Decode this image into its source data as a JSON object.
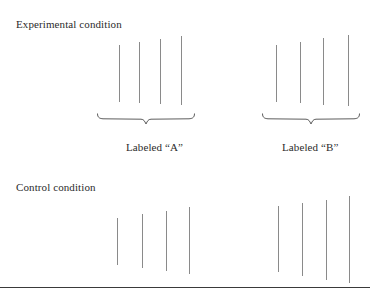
{
  "figure": {
    "width": 370,
    "height": 295,
    "background_color": "#ffffff",
    "line_color": "#8a8a8a",
    "brace_color": "#5d5d5d",
    "text_color": "#2b2b2b",
    "rule_color": "#3a3a3a"
  },
  "conditions": [
    {
      "id": "experimental",
      "label": "Experimental condition",
      "label_x": 16,
      "label_y": 18,
      "groups": [
        {
          "id": "group-a",
          "label": "Labeled “A”",
          "label_x": 126,
          "label_y": 141,
          "brace": {
            "x": 97,
            "y": 113,
            "width": 98,
            "height": 12
          },
          "lines": [
            {
              "x": 119,
              "top": 45,
              "bottom": 102
            },
            {
              "x": 139,
              "top": 42,
              "bottom": 103
            },
            {
              "x": 160,
              "top": 39,
              "bottom": 104
            },
            {
              "x": 181,
              "top": 36,
              "bottom": 105
            }
          ]
        },
        {
          "id": "group-b",
          "label": "Labeled “B”",
          "label_x": 282,
          "label_y": 141,
          "brace": {
            "x": 262,
            "y": 113,
            "width": 98,
            "height": 12
          },
          "lines": [
            {
              "x": 276,
              "top": 45,
              "bottom": 102
            },
            {
              "x": 300,
              "top": 42,
              "bottom": 103
            },
            {
              "x": 323,
              "top": 38,
              "bottom": 105
            },
            {
              "x": 348,
              "top": 35,
              "bottom": 106
            }
          ]
        }
      ]
    },
    {
      "id": "control",
      "label": "Control condition",
      "label_x": 16,
      "label_y": 181,
      "groups": [
        {
          "id": "control-left",
          "label": "",
          "label_x": 0,
          "label_y": 0,
          "brace": null,
          "lines": [
            {
              "x": 117,
              "top": 218,
              "bottom": 265
            },
            {
              "x": 142,
              "top": 214,
              "bottom": 268
            },
            {
              "x": 166,
              "top": 211,
              "bottom": 271
            },
            {
              "x": 189,
              "top": 207,
              "bottom": 274
            }
          ]
        },
        {
          "id": "control-right",
          "label": "",
          "label_x": 0,
          "label_y": 0,
          "brace": null,
          "lines": [
            {
              "x": 278,
              "top": 206,
              "bottom": 272
            },
            {
              "x": 302,
              "top": 203,
              "bottom": 276
            },
            {
              "x": 326,
              "top": 200,
              "bottom": 280
            },
            {
              "x": 349,
              "top": 196,
              "bottom": 283
            }
          ]
        }
      ]
    }
  ],
  "bottom_rule": {
    "y": 287
  }
}
